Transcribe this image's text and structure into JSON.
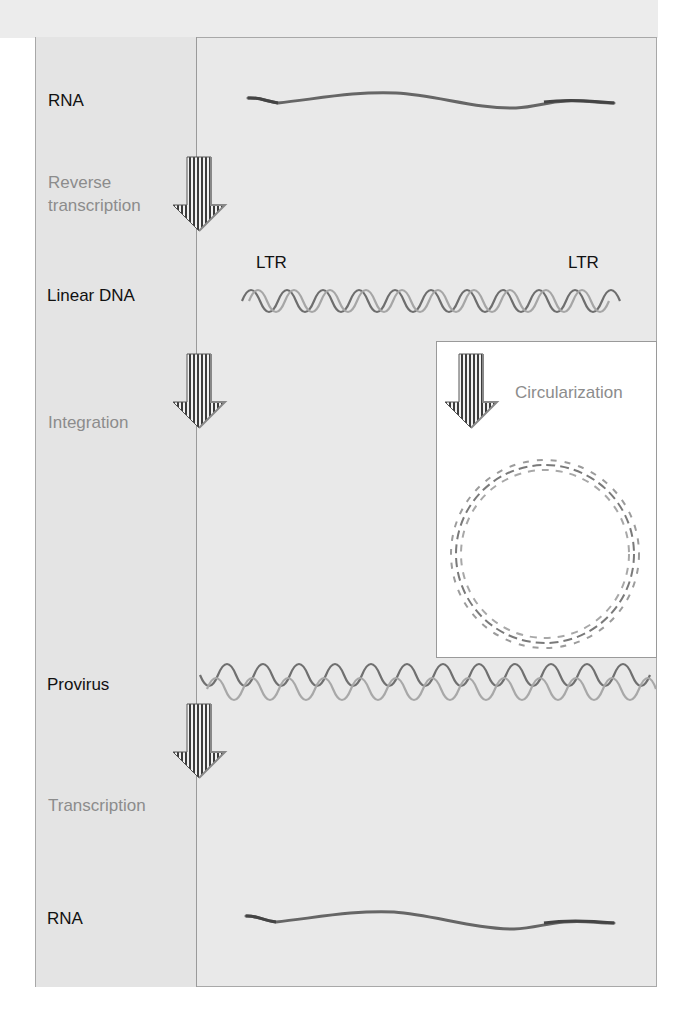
{
  "diagram": {
    "stages": [
      {
        "label": "RNA"
      },
      {
        "label": "Linear DNA"
      },
      {
        "label": "Provirus"
      },
      {
        "label": "RNA"
      }
    ],
    "processes": [
      {
        "label_line1": "Reverse",
        "label_line2": "transcription"
      },
      {
        "label": "Integration"
      },
      {
        "label": "Transcription"
      }
    ],
    "ltr_left": "LTR",
    "ltr_right": "LTR",
    "inset": {
      "label": "Circularization"
    },
    "colors": {
      "background": "#e9e9e9",
      "left_column": "#e4e4e4",
      "border": "#a8a8a8",
      "stage_text": "#111111",
      "process_text": "#8c8c8c",
      "rna_strand": "#6a6a6a",
      "dna_strand_dark": "#6e6e6e",
      "dna_strand_light": "#a6a6a6",
      "inset_background": "#ffffff"
    }
  }
}
